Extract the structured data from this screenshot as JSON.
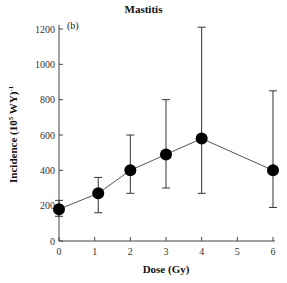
{
  "chart_data": {
    "type": "line",
    "title": "Mastitis",
    "panel_label": "(b)",
    "xlabel": "Dose (Gy)",
    "ylabel": "Incidence (10⁵ WY)⁻¹",
    "ylabel_parts": {
      "main": "Incidence (10",
      "sup1": "5",
      "mid": " WY)",
      "sup2": "-1"
    },
    "xlim": [
      0,
      6
    ],
    "ylim": [
      0,
      1200
    ],
    "xticks": [
      0,
      1,
      2,
      3,
      4,
      5,
      6
    ],
    "yticks": [
      0,
      200,
      400,
      600,
      800,
      1000,
      1200
    ],
    "grid": false,
    "legend": null,
    "series": [
      {
        "name": "Mastitis",
        "x": [
          0,
          1.1,
          2,
          3,
          4,
          6
        ],
        "values": [
          180,
          270,
          400,
          490,
          580,
          400
        ],
        "error_low": [
          140,
          160,
          270,
          300,
          270,
          190
        ],
        "error_high": [
          230,
          360,
          600,
          800,
          1210,
          850
        ],
        "marker": "filled-circle",
        "color": "#000000"
      }
    ]
  }
}
